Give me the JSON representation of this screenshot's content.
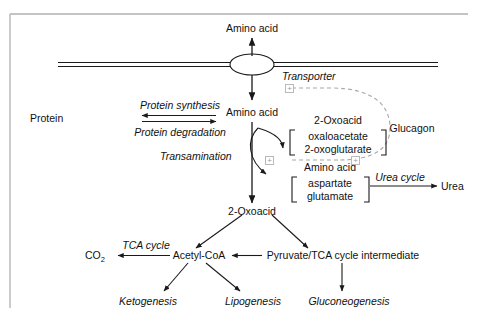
{
  "figure": {
    "frame_color": "#b0b0b0",
    "line_color": "#1a1a1a",
    "dashed_color": "#a8a8a8",
    "plus_symbol": "+"
  },
  "nodes": {
    "amino_acid_extracellular": "Amino acid",
    "transporter": "Transporter",
    "amino_acid_intracellular": "Amino acid",
    "protein": "Protein",
    "oxoacid_pool_title": "2-Oxoacid",
    "oxoacid_pool_member_1": "oxaloacetate",
    "oxoacid_pool_member_2": "2-oxoglutarate",
    "amino_acid_pool_title": "Amino acid",
    "amino_acid_pool_member_1": "aspartate",
    "amino_acid_pool_member_2": "glutamate",
    "glucagon": "Glucagon",
    "urea": "Urea",
    "oxoacid": "2-Oxoacid",
    "co2": "CO",
    "co2_subscript": "2",
    "acetyl_coa": "Acetyl-CoA",
    "pyruvate": "Pyruvate/TCA cycle intermediate",
    "ketogenesis": "Ketogenesis",
    "lipogenesis": "Lipogenesis",
    "gluconeogenesis": "Gluconeogenesis"
  },
  "process_labels": {
    "protein_synthesis": "Protein synthesis",
    "protein_degradation": "Protein degradation",
    "transamination": "Transamination",
    "urea_cycle": "Urea cycle",
    "tca_cycle": "TCA cycle"
  },
  "regulation": {
    "effector": "Glucagon",
    "sign": "+",
    "targets": [
      "Transporter",
      "Transamination"
    ]
  }
}
